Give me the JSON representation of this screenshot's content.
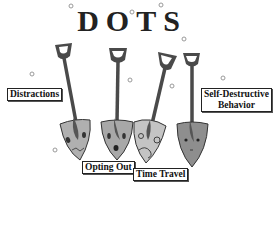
{
  "title": "DOTS",
  "labels": {
    "distractions": "Distractions",
    "opting_out": "Opting Out",
    "time_travel": "Time Travel",
    "self_destructive_line1": "Self-Destructive",
    "self_destructive_line2": "Behavior"
  },
  "colors": {
    "handle": "#4a4a4a",
    "blade_light": "#b8b8b8",
    "blade_mid": "#9a9a9a",
    "blade_dark": "#888888",
    "outline": "#333333",
    "bubble": "#aaaaaa"
  }
}
